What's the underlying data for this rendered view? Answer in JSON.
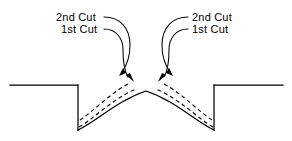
{
  "diagram": {
    "stroke_color": "#000000",
    "background_color": "#ffffff",
    "labels": {
      "left": {
        "second_cut": "2nd  Cut",
        "first_cut": "1st  Cut"
      },
      "right": {
        "second_cut": "2nd  Cut",
        "first_cut": "1st  Cut"
      }
    },
    "geometry": {
      "baseline_y": 85,
      "baseline_left_start_x": 10,
      "baseline_left_end_x": 78,
      "baseline_right_start_x": 215,
      "baseline_right_end_x": 283,
      "notch_bottom_y": 130,
      "arch_peak_x": 146,
      "arch_peak_y": 91
    }
  }
}
